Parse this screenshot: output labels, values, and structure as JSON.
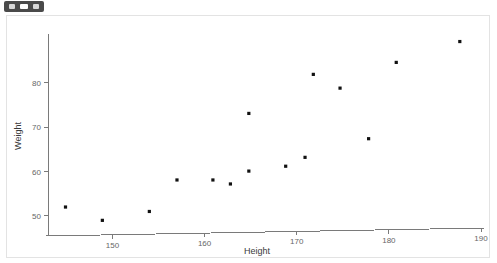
{
  "toolbar": {
    "name": "window-toolbar-chip",
    "buttons": [
      "chip-button-1",
      "chip-button-2",
      "chip-button-3"
    ]
  },
  "colors": {
    "point": "#111111",
    "axis": "#7a7a7a",
    "tick_label": "#666666",
    "axis_title": "#3a3a3a",
    "panel_border": "#e3e3e3",
    "background": "#ffffff",
    "toolbar_chip": "#4a4a4a"
  },
  "chart_data": {
    "type": "scatter",
    "title": "",
    "xlabel": "Height",
    "ylabel": "Weight",
    "xlim": [
      143,
      190
    ],
    "ylim": [
      47.5,
      91
    ],
    "xticks": [
      150,
      160,
      170,
      180,
      190
    ],
    "yticks": [
      50,
      60,
      70,
      80
    ],
    "grid": false,
    "legend": false,
    "series": [
      {
        "name": "Height vs Weight",
        "marker": "square",
        "color": "#111111",
        "x": [
          144.9,
          148.9,
          154.0,
          157.0,
          160.9,
          162.8,
          164.8,
          164.8,
          168.8,
          170.9,
          171.8,
          174.7,
          177.8,
          180.8,
          187.7
        ],
        "y": [
          52.0,
          49.0,
          51.0,
          58.1,
          58.1,
          57.2,
          60.1,
          73.1,
          61.2,
          63.2,
          81.9,
          78.8,
          67.4,
          84.6,
          89.3
        ]
      }
    ],
    "points": [
      {
        "height": 144.9,
        "weight": 52.0
      },
      {
        "height": 148.9,
        "weight": 49.0
      },
      {
        "height": 154.0,
        "weight": 51.0
      },
      {
        "height": 157.0,
        "weight": 58.1
      },
      {
        "height": 160.9,
        "weight": 58.1
      },
      {
        "height": 162.8,
        "weight": 57.2
      },
      {
        "height": 164.8,
        "weight": 60.1
      },
      {
        "height": 164.8,
        "weight": 73.1
      },
      {
        "height": 168.8,
        "weight": 61.2
      },
      {
        "height": 170.9,
        "weight": 63.2
      },
      {
        "height": 171.8,
        "weight": 81.9
      },
      {
        "height": 174.7,
        "weight": 78.8
      },
      {
        "height": 177.8,
        "weight": 67.4
      },
      {
        "height": 180.8,
        "weight": 84.6
      },
      {
        "height": 187.7,
        "weight": 89.3
      }
    ]
  }
}
